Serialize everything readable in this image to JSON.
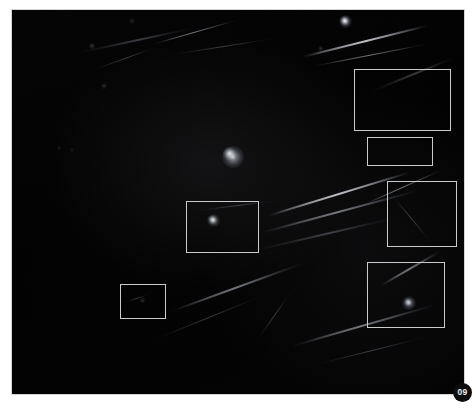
{
  "figure": {
    "page_badge_label": "09",
    "canvas": {
      "background_color": "#030303",
      "border_color": "#d4d4d4",
      "width_px": 454,
      "height_px": 386
    },
    "roi_color": "#c9cbcd"
  },
  "chart_data": {
    "type": "scatter",
    "title": "",
    "subtitle": "",
    "xlabel": "",
    "ylabel": "",
    "grid": false,
    "legend_position": "none",
    "axis_ranges": {
      "x": [
        0,
        454
      ],
      "y": [
        0,
        386
      ]
    },
    "roi_boxes": [
      {
        "id": "roi-1",
        "label": "",
        "x": 342,
        "y": 59,
        "w": 97,
        "h": 62
      },
      {
        "id": "roi-2",
        "label": "",
        "x": 355,
        "y": 127,
        "w": 66,
        "h": 29
      },
      {
        "id": "roi-3",
        "label": "",
        "x": 375,
        "y": 171,
        "w": 70,
        "h": 66
      },
      {
        "id": "roi-4",
        "label": "",
        "x": 355,
        "y": 252,
        "w": 78,
        "h": 66
      },
      {
        "id": "roi-5",
        "label": "",
        "x": 174,
        "y": 191,
        "w": 73,
        "h": 52
      },
      {
        "id": "roi-6",
        "label": "",
        "x": 108,
        "y": 274,
        "w": 46,
        "h": 35
      }
    ],
    "point_sources": [
      {
        "id": "ps-1",
        "x": 332,
        "y": 10,
        "brightness": 0.9,
        "size": 9
      },
      {
        "id": "ps-2",
        "x": 120,
        "y": 11,
        "brightness": 0.3,
        "size": 6
      },
      {
        "id": "ps-3",
        "x": 217,
        "y": 143,
        "brightness": 0.95,
        "size": 13
      },
      {
        "id": "ps-4",
        "x": 80,
        "y": 36,
        "brightness": 0.45,
        "size": 6
      },
      {
        "id": "ps-5",
        "x": 308,
        "y": 38,
        "brightness": 0.38,
        "size": 5
      },
      {
        "id": "ps-6",
        "x": 92,
        "y": 76,
        "brightness": 0.35,
        "size": 6
      },
      {
        "id": "ps-7",
        "x": 200,
        "y": 209,
        "brightness": 0.8,
        "size": 9
      },
      {
        "id": "ps-8",
        "x": 130,
        "y": 290,
        "brightness": 0.4,
        "size": 5
      },
      {
        "id": "ps-9",
        "x": 396,
        "y": 292,
        "brightness": 0.7,
        "size": 8
      },
      {
        "id": "ps-10",
        "x": 47,
        "y": 138,
        "brightness": 0.22,
        "size": 4
      },
      {
        "id": "ps-11",
        "x": 60,
        "y": 140,
        "brightness": 0.2,
        "size": 4
      }
    ],
    "streaks": [
      {
        "id": "st-1",
        "x": 65,
        "y": 42,
        "length": 120,
        "thickness": 1.6,
        "angle": -12,
        "intensity": "faint"
      },
      {
        "id": "st-2",
        "x": 140,
        "y": 34,
        "length": 90,
        "thickness": 1.4,
        "angle": -16,
        "intensity": "normal"
      },
      {
        "id": "st-3",
        "x": 155,
        "y": 45,
        "length": 110,
        "thickness": 1.2,
        "angle": -9,
        "intensity": "faint"
      },
      {
        "id": "st-4",
        "x": 290,
        "y": 46,
        "length": 130,
        "thickness": 1.8,
        "angle": -14,
        "intensity": "bright"
      },
      {
        "id": "st-5",
        "x": 300,
        "y": 56,
        "length": 120,
        "thickness": 1.3,
        "angle": -11,
        "intensity": "normal"
      },
      {
        "id": "st-6",
        "x": 80,
        "y": 60,
        "length": 70,
        "thickness": 1.1,
        "angle": -20,
        "intensity": "faint"
      },
      {
        "id": "st-7",
        "x": 255,
        "y": 205,
        "length": 150,
        "thickness": 2.2,
        "angle": -17,
        "intensity": "bright"
      },
      {
        "id": "st-8",
        "x": 248,
        "y": 222,
        "length": 165,
        "thickness": 1.8,
        "angle": -15,
        "intensity": "normal"
      },
      {
        "id": "st-9",
        "x": 240,
        "y": 240,
        "length": 150,
        "thickness": 1.5,
        "angle": -13,
        "intensity": "faint"
      },
      {
        "id": "st-10",
        "x": 185,
        "y": 200,
        "length": 80,
        "thickness": 1.2,
        "angle": -7,
        "intensity": "faint"
      },
      {
        "id": "st-11",
        "x": 160,
        "y": 300,
        "length": 140,
        "thickness": 1.6,
        "angle": -20,
        "intensity": "normal"
      },
      {
        "id": "st-12",
        "x": 140,
        "y": 330,
        "length": 120,
        "thickness": 1.3,
        "angle": -22,
        "intensity": "faint"
      },
      {
        "id": "st-13",
        "x": 280,
        "y": 335,
        "length": 150,
        "thickness": 1.7,
        "angle": -16,
        "intensity": "normal"
      },
      {
        "id": "st-14",
        "x": 300,
        "y": 355,
        "length": 120,
        "thickness": 1.2,
        "angle": -14,
        "intensity": "faint"
      },
      {
        "id": "st-15",
        "x": 350,
        "y": 195,
        "length": 90,
        "thickness": 1.4,
        "angle": -24,
        "intensity": "normal"
      },
      {
        "id": "st-16",
        "x": 368,
        "y": 275,
        "length": 70,
        "thickness": 1.8,
        "angle": -30,
        "intensity": "normal"
      },
      {
        "id": "st-17",
        "x": 360,
        "y": 80,
        "length": 90,
        "thickness": 1.5,
        "angle": -22,
        "intensity": "faint"
      },
      {
        "id": "st-18",
        "x": 112,
        "y": 292,
        "length": 26,
        "thickness": 1.0,
        "angle": -18,
        "intensity": "faint"
      },
      {
        "id": "st-19",
        "x": 380,
        "y": 185,
        "length": 60,
        "thickness": 1.2,
        "angle": 50,
        "intensity": "faint"
      },
      {
        "id": "st-20",
        "x": 245,
        "y": 330,
        "length": 60,
        "thickness": 1.0,
        "angle": -55,
        "intensity": "faint"
      }
    ],
    "diffuse_blobs": [
      {
        "id": "bl-1",
        "x": 221,
        "y": 147,
        "size": 22,
        "intensity": 0.85
      },
      {
        "id": "bl-2",
        "x": 397,
        "y": 293,
        "size": 14,
        "intensity": 0.7
      },
      {
        "id": "bl-3",
        "x": 201,
        "y": 210,
        "size": 13,
        "intensity": 0.72
      },
      {
        "id": "bl-4",
        "x": 333,
        "y": 11,
        "size": 13,
        "intensity": 0.8
      }
    ]
  }
}
